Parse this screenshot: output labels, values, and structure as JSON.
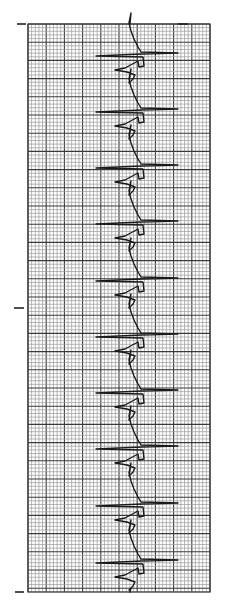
{
  "image": {
    "subject": "ECG rhythm strip on graph paper (rotated vertical)",
    "width": 227,
    "height": 614,
    "background": "#ffffff"
  },
  "grid": {
    "left": 28,
    "top": 24,
    "right": 210,
    "bottom": 592,
    "minor_spacing": 3.64,
    "major_every": 5,
    "minor_color": "#9a9a9a",
    "major_color": "#3a3a3a"
  },
  "calibration_ticks": [
    {
      "side": "left",
      "x": 17,
      "y": 24,
      "w": 9
    },
    {
      "side": "left",
      "x": 14,
      "y": 308,
      "w": 10
    },
    {
      "side": "left",
      "x": 15,
      "y": 592,
      "w": 9
    },
    {
      "side": "right",
      "x": 178,
      "y": 24,
      "w": 10
    }
  ],
  "trace": {
    "color": "#1a1a1a",
    "baseline_x": 133,
    "beat_count": 10,
    "beat_spike_y": [
      53,
      109,
      165,
      221,
      278,
      334,
      390,
      446,
      503,
      560
    ],
    "right_spike_x": 178,
    "left_spike_x": 96
  }
}
